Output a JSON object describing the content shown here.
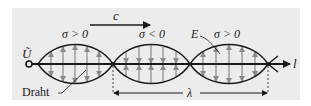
{
  "diagram": {
    "labels": {
      "velocity": "c",
      "voltage": "Ũ",
      "wire": "Draht",
      "field": "E",
      "axis": "l",
      "wavelength": "λ",
      "charge_regions": [
        "σ > 0",
        "σ < 0",
        "σ > 0"
      ]
    },
    "colors": {
      "background": "#ececec",
      "lines": "#1a1a1a",
      "field_arrows": "#8a8a8a"
    }
  }
}
